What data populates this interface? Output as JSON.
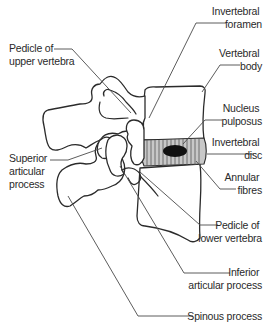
{
  "figure": {
    "colors": {
      "line": "#2b2b2b",
      "disc_fill": "#c8c8c8",
      "nucleus_fill": "#111111",
      "text": "#2a2a2a",
      "background": "#ffffff"
    }
  },
  "labels": {
    "intervertebral_foramen": [
      "Invertebral",
      "foramen"
    ],
    "pedicle_upper": [
      "Pedicle of",
      "upper vertebra"
    ],
    "vertebral_body": [
      "Vertebral",
      "body"
    ],
    "nucleus_pulposus": [
      "Nucleus",
      "pulposus"
    ],
    "intervertebral_disc": [
      "Invertebral",
      "disc"
    ],
    "superior_articular": [
      "Superior",
      "articular",
      "process"
    ],
    "annular_fibres": [
      "Annular",
      "fibres"
    ],
    "pedicle_lower": [
      "Pedicle of",
      "lower vertebra"
    ],
    "inferior_articular": [
      "Inferior",
      "articular process"
    ],
    "spinous_process": [
      "Spinous process"
    ]
  }
}
